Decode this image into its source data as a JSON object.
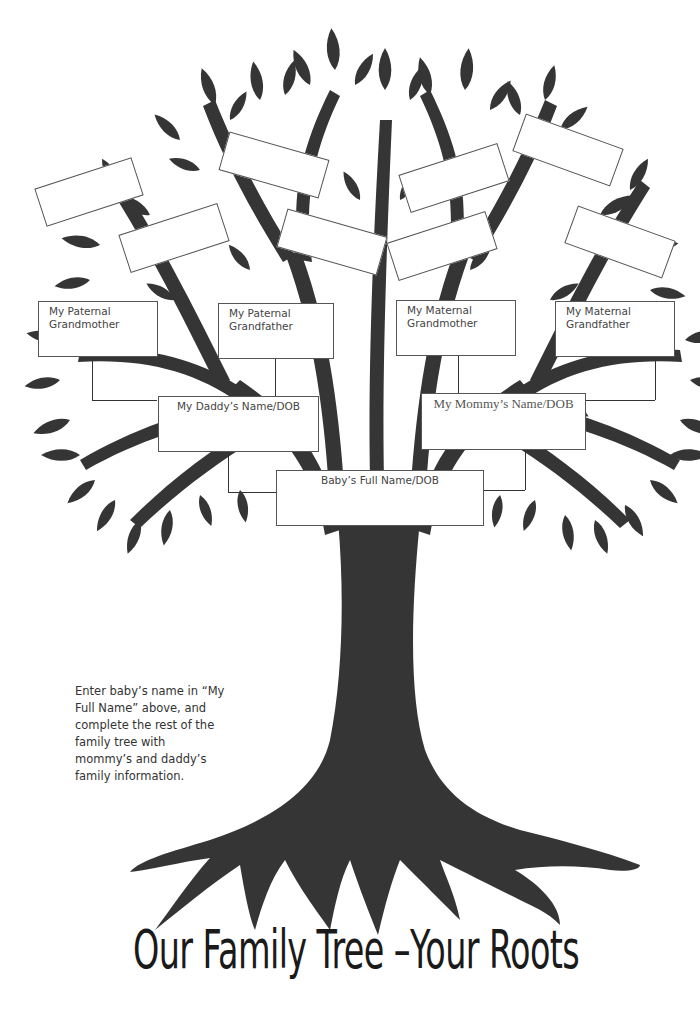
{
  "document": {
    "title": "Our Family Tree –Your Roots",
    "instructions": "Enter baby’s name in “My Full Name” above, and complete the rest of the family tree with mommy’s and daddy’s family information."
  },
  "colors": {
    "tree": "#353535",
    "box_border": "#555555",
    "background": "#ffffff",
    "text": "#444444"
  },
  "boxes": {
    "paternal_grandmother": "My Paternal Grandmother",
    "paternal_grandfather": "My Paternal Grandfather",
    "maternal_grandmother": "My Maternal Grandmother",
    "maternal_grandfather": "My Maternal Grandfather",
    "daddy": "My Daddy’s Name/DOB",
    "mommy": "My Mommy’s Name/DOB",
    "baby": "Baby’s Full Name/DOB"
  },
  "great_grandparent_boxes": [
    {
      "label": "",
      "position": "far-left"
    },
    {
      "label": "",
      "position": "left-inner"
    },
    {
      "label": "",
      "position": "center-left-top"
    },
    {
      "label": "",
      "position": "center-left"
    },
    {
      "label": "",
      "position": "center-right-top"
    },
    {
      "label": "",
      "position": "center-right"
    },
    {
      "label": "",
      "position": "far-right-top"
    },
    {
      "label": "",
      "position": "far-right"
    }
  ]
}
